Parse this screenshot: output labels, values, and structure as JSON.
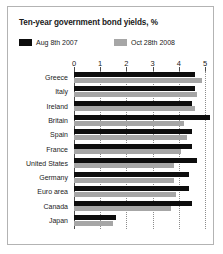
{
  "chart": {
    "title": "Ten-year government bond yields, %",
    "legend": [
      {
        "label": "Aug 8th 2007",
        "color": "#0d0d0d",
        "icon": "legend-swatch-black"
      },
      {
        "label": "Oct 28th 2008",
        "color": "#a6a6a6",
        "icon": "legend-swatch-gray"
      }
    ]
  },
  "chart_data": {
    "type": "bar",
    "orientation": "horizontal",
    "title": "Ten-year government bond yields, %",
    "xlabel": "",
    "ylabel": "",
    "xlim": [
      0,
      5
    ],
    "xticks": [
      "0",
      "1",
      "2",
      "3",
      "4",
      "5"
    ],
    "grid": true,
    "legend_position": "top",
    "categories": [
      "Greece",
      "Italy",
      "Ireland",
      "Britain",
      "Spain",
      "France",
      "United States",
      "Germany",
      "Euro area",
      "Canada",
      "Japan"
    ],
    "series": [
      {
        "name": "Aug 8th 2007",
        "color": "#0d0d0d",
        "values": [
          4.6,
          4.6,
          4.5,
          5.2,
          4.5,
          4.5,
          4.7,
          4.4,
          4.4,
          4.5,
          1.6
        ]
      },
      {
        "name": "Oct 28th 2008",
        "color": "#a6a6a6",
        "values": [
          4.9,
          4.7,
          4.6,
          4.2,
          4.3,
          4.1,
          3.8,
          3.8,
          3.9,
          3.7,
          1.5
        ]
      }
    ]
  }
}
